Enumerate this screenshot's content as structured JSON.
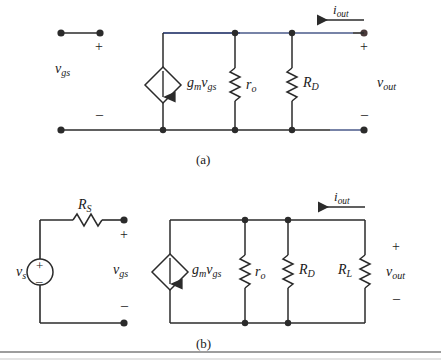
{
  "figure": {
    "part_a_label": "(a)",
    "part_b_label": "(b)"
  },
  "symbols": {
    "plus": "+",
    "minus": "–"
  },
  "circuit_a": {
    "name": "small-signal-model-unloaded",
    "input_label_main": "v",
    "input_label_sub": "gs",
    "source_label_main": "g",
    "source_label_sub1": "m",
    "source_label_mid": "v",
    "source_label_sub2": "gs",
    "ro_main": "r",
    "ro_sub": "o",
    "rd_main": "R",
    "rd_sub": "D",
    "current_main": "i",
    "current_sub": "out",
    "output_main": "v",
    "output_sub": "out",
    "input_plus": "+",
    "input_minus": "–",
    "output_plus": "+",
    "output_minus": "–"
  },
  "circuit_b": {
    "name": "small-signal-model-with-source-and-load",
    "source_main": "v",
    "source_sub": "s",
    "source_plus": "+",
    "source_minus": "–",
    "rs_main": "R",
    "rs_sub": "S",
    "input_label_main": "v",
    "input_label_sub": "gs",
    "input_plus": "+",
    "input_minus": "–",
    "dep_source_main": "g",
    "dep_source_sub1": "m",
    "dep_source_mid": "v",
    "dep_source_sub2": "gs",
    "ro_main": "r",
    "ro_sub": "o",
    "rd_main": "R",
    "rd_sub": "D",
    "rl_main": "R",
    "rl_sub": "L",
    "current_main": "i",
    "current_sub": "out",
    "output_main": "v",
    "output_sub": "out",
    "output_plus": "+",
    "output_minus": "–"
  },
  "colors": {
    "wire": "#2b2b2b",
    "accent_wire": "#4a5a8a",
    "text": "#1a1a1a",
    "rule": "#8a8a8a",
    "background": "#ffffff"
  }
}
